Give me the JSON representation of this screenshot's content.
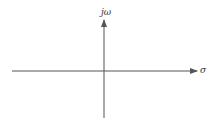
{
  "diagram": {
    "axes": {
      "horizontal": {
        "label": "σ",
        "direction": "right"
      },
      "vertical": {
        "label": "jω",
        "direction": "up"
      }
    },
    "colors": {
      "axis": "#555555",
      "text": "#333333",
      "background": "#ffffff"
    }
  }
}
